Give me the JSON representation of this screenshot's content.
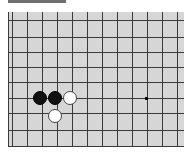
{
  "game": {
    "type": "go-board-fragment",
    "colors": {
      "board": "#d6d6d6",
      "line": "#3a3a3a",
      "black": "#111111",
      "white": "#ffffff"
    },
    "grid": {
      "vertical_x": [
        4,
        19,
        34,
        49,
        64,
        79,
        94,
        109,
        124,
        139,
        154,
        169
      ],
      "horizontal_y": [
        8,
        25,
        40,
        55,
        70,
        86,
        101,
        118
      ]
    },
    "stones": [
      {
        "color": "black",
        "x": 32,
        "y": 86
      },
      {
        "color": "black",
        "x": 47,
        "y": 86
      },
      {
        "color": "white",
        "x": 62,
        "y": 86
      },
      {
        "color": "white",
        "x": 47,
        "y": 104
      }
    ],
    "star_points": [
      {
        "x": 138,
        "y": 86
      }
    ]
  }
}
